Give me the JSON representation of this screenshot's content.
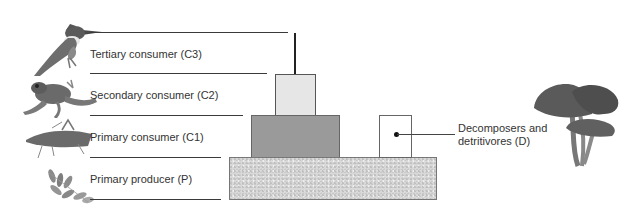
{
  "diagram": {
    "type": "ecological energy pyramid",
    "levels": [
      {
        "id": "C3",
        "label": "Tertiary consumer (C3)",
        "organism": "kingfisher"
      },
      {
        "id": "C2",
        "label": "Secondary consumer (C2)",
        "organism": "frog"
      },
      {
        "id": "C1",
        "label": "Primary consumer (C1)",
        "organism": "grasshopper"
      },
      {
        "id": "P",
        "label": "Primary producer (P)",
        "organism": "leaves"
      }
    ],
    "decomposers": {
      "id": "D",
      "label_line1": "Decomposers and",
      "label_line2": "detritivores (D)",
      "organism": "mushrooms"
    },
    "colors": {
      "c2_fill": "#e6e6e6",
      "c1_fill": "#9a9a9a",
      "p_fill": "#d9d9d9",
      "d_fill": "#ffffff",
      "line": "#3a3a3a"
    }
  }
}
